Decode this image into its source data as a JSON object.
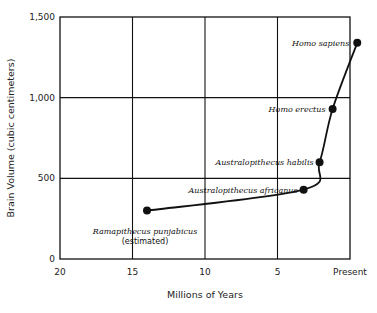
{
  "chart_data": {
    "type": "line",
    "title": "",
    "xlabel": "Millions of Years",
    "ylabel": "Brain Volume (cubic centimeters)",
    "x_ticks": [
      20,
      15,
      10,
      5,
      0
    ],
    "x_tick_labels": [
      "20",
      "15",
      "10",
      "5",
      "Present"
    ],
    "y_ticks": [
      0,
      500,
      1000,
      1500
    ],
    "y_tick_labels": [
      "0",
      "500",
      "1,000",
      "1,500"
    ],
    "xlim": [
      20,
      0
    ],
    "ylim": [
      0,
      1500
    ],
    "grid": true,
    "legend": null,
    "series": [
      {
        "name": "Hominid brain volume",
        "points": [
          {
            "label": "Ramapithecus punjabicus",
            "sublabel": "(estimated)",
            "x": 14,
            "y": 300
          },
          {
            "label": "Australopithecus africanus",
            "x": 3.2,
            "y": 430
          },
          {
            "label": "Australopithecus habilis",
            "x": 2.1,
            "y": 600
          },
          {
            "label": "Homo erectus",
            "x": 1.2,
            "y": 930
          },
          {
            "label": "Homo sapiens",
            "x": -0.5,
            "y": 1340
          }
        ]
      }
    ]
  }
}
